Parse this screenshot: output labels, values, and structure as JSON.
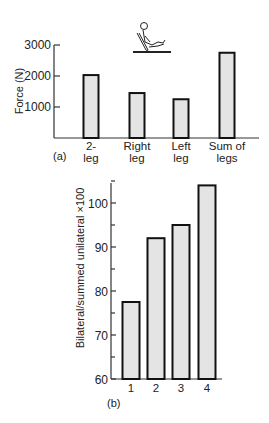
{
  "chart_data": [
    {
      "type": "bar",
      "panel": "(a)",
      "title": "",
      "xlabel": "",
      "ylabel": "Force (N)",
      "categories": [
        "2-leg",
        "Right leg",
        "Left leg",
        "Sum of legs"
      ],
      "category_lines": [
        [
          "2-",
          "leg"
        ],
        [
          "Right",
          "leg"
        ],
        [
          "Left",
          "leg"
        ],
        [
          "Sum of",
          "legs"
        ]
      ],
      "values": [
        2030,
        1450,
        1250,
        2750
      ],
      "yticks": [
        1000,
        2000,
        3000
      ],
      "ytick_labels": [
        "1000",
        "2000",
        "3000"
      ],
      "ylim": [
        0,
        3000
      ],
      "grid": false,
      "annotation": "seated leg-press figure icon"
    },
    {
      "type": "bar",
      "panel": "(b)",
      "title": "",
      "xlabel": "",
      "ylabel": "Bilateral/summed unilateral ×100",
      "categories": [
        "1",
        "2",
        "3",
        "4"
      ],
      "values": [
        77.5,
        92,
        95,
        104
      ],
      "yticks": [
        60,
        70,
        80,
        90,
        100
      ],
      "ytick_labels": [
        "60",
        "70",
        "80",
        "90",
        "100"
      ],
      "ylim": [
        60,
        105
      ],
      "grid": false
    }
  ]
}
